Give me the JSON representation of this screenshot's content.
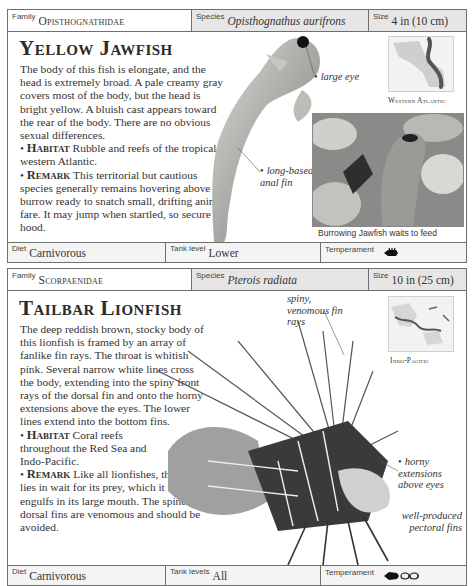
{
  "cards": [
    {
      "header": {
        "family_label": "Family",
        "family": "Opisthognathidae",
        "species_label": "Species",
        "species": "Opisthognathus aurifrons",
        "size_label": "Size",
        "size": "4 in (10 cm)"
      },
      "title": "Yellow Jawfish",
      "description": "The body of this fish is elongate, and the head is extremely broad. A pale creamy gray covers most of the body, but the head is bright yellow. A bluish cast appears toward the rear of the body. There are no obvious sexual differences.",
      "habitat_label": "Habitat",
      "habitat": "Rubble and reefs of the tropical western Atlantic.",
      "remark_label": "Remark",
      "remark": "This territorial but cautious species generally remains hovering above its burrow ready to snatch small, drifting animal fare. It may jump when startled, so secure the hood.",
      "callouts": [
        "large eye",
        "long-based anal fin"
      ],
      "map_label": "Western Atlantic",
      "photo_caption": "Burrowing Jawfish waits to feed",
      "footer": {
        "diet_label": "Diet",
        "diet": "Carnivorous",
        "tank_label": "Tank level",
        "tank": "Lower",
        "temperament_label": "Temperament",
        "temperament_icon": "aggressive-fish-icon"
      }
    },
    {
      "header": {
        "family_label": "Family",
        "family": "Scorpaenidae",
        "species_label": "Species",
        "species": "Pterois radiata",
        "size_label": "Size",
        "size": "10 in (25 cm)"
      },
      "title": "Tailbar Lionfish",
      "description": "The deep reddish brown, stocky body of this lionfish is framed by an array of fanlike fin rays. The throat is whitish pink. Several narrow white lines cross the body, extending into the spiny front rays of the dorsal fin and onto the horny extensions above the eyes. The lower lines extend into the bottom fins.",
      "habitat_label": "Habitat",
      "habitat": "Coral reefs throughout the Red Sea and Indo-Pacific.",
      "remark_label": "Remark",
      "remark": "Like all lionfishes, this species lies in wait for its prey, which it then engulfs in its large mouth. The spines of its dorsal fins are venomous and should be avoided.",
      "callouts": [
        "spiny, venomous fin rays",
        "horny extensions above eyes",
        "well-produced pectoral fins"
      ],
      "map_label": "Indo-Pacific",
      "footer": {
        "diet_label": "Diet",
        "diet": "Carnivorous",
        "tank_label": "Tank levels",
        "tank": "All",
        "temperament_label": "Temperament",
        "temperament_icon": "predator-eats-small-fish-icon"
      }
    }
  ]
}
